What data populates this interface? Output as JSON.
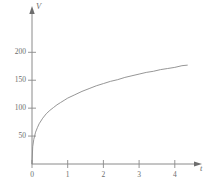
{
  "chart_data": {
    "type": "line",
    "title": "",
    "subtitle": "",
    "xlabel": "t",
    "ylabel": "V",
    "xlim": [
      -0.15,
      4.45
    ],
    "ylim": [
      -8,
      215
    ],
    "grid": false,
    "legend": null,
    "xticks": [
      0,
      1,
      2,
      3,
      4
    ],
    "xtick_labels": [
      "0",
      "1",
      "2",
      "3",
      "4"
    ],
    "yticks": [
      50,
      100,
      150,
      200
    ],
    "ytick_labels": [
      "50",
      "100",
      "150",
      "200"
    ],
    "series": [
      {
        "name": "V(t)",
        "color": "#8a8a8a",
        "x": [
          0,
          0.02,
          0.05,
          0.1,
          0.15,
          0.2,
          0.3,
          0.4,
          0.5,
          0.6,
          0.7,
          0.8,
          0.9,
          1.0,
          1.2,
          1.4,
          1.6,
          1.8,
          2.0,
          2.2,
          2.4,
          2.6,
          2.8,
          3.0,
          3.2,
          3.4,
          3.6,
          3.8,
          4.0,
          4.2,
          4.35
        ],
        "y": [
          0,
          31,
          44,
          57,
          65,
          72,
          82,
          90,
          96,
          101,
          106,
          110,
          114,
          118,
          124,
          130,
          135,
          140,
          144,
          148,
          151,
          155,
          158,
          161,
          164,
          166,
          169,
          171,
          173,
          176,
          177
        ]
      }
    ],
    "axis_color": "#8a8a8a",
    "curve_color": "#8a8a8a",
    "background": "#ffffff"
  },
  "axes": {
    "y_axis_title": "V",
    "x_axis_title": "t"
  }
}
